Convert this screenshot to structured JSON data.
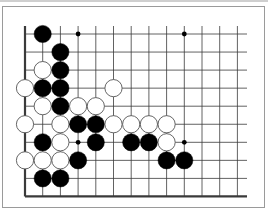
{
  "diagram": {
    "type": "go-board-fragment",
    "columns": 13,
    "rows": 10,
    "edges": {
      "left": true,
      "bottom": true,
      "top": false,
      "right": false
    },
    "star_points": [
      {
        "col": 3,
        "row": 0
      },
      {
        "col": 9,
        "row": 0
      },
      {
        "col": 3,
        "row": 6
      },
      {
        "col": 9,
        "row": 6
      }
    ],
    "stones": [
      {
        "color": "black",
        "col": 1,
        "row": 0
      },
      {
        "color": "black",
        "col": 2,
        "row": 1
      },
      {
        "color": "white",
        "col": 1,
        "row": 2
      },
      {
        "color": "black",
        "col": 2,
        "row": 2
      },
      {
        "color": "white",
        "col": 0,
        "row": 3
      },
      {
        "color": "black",
        "col": 1,
        "row": 3
      },
      {
        "color": "black",
        "col": 2,
        "row": 3
      },
      {
        "color": "white",
        "col": 5,
        "row": 3
      },
      {
        "color": "white",
        "col": 1,
        "row": 4
      },
      {
        "color": "black",
        "col": 2,
        "row": 4
      },
      {
        "color": "white",
        "col": 3,
        "row": 4
      },
      {
        "color": "white",
        "col": 4,
        "row": 4
      },
      {
        "color": "white",
        "col": 0,
        "row": 5
      },
      {
        "color": "white",
        "col": 2,
        "row": 5
      },
      {
        "color": "black",
        "col": 3,
        "row": 5
      },
      {
        "color": "black",
        "col": 4,
        "row": 5
      },
      {
        "color": "white",
        "col": 5,
        "row": 5
      },
      {
        "color": "white",
        "col": 6,
        "row": 5
      },
      {
        "color": "white",
        "col": 7,
        "row": 5
      },
      {
        "color": "white",
        "col": 8,
        "row": 5
      },
      {
        "color": "black",
        "col": 1,
        "row": 6
      },
      {
        "color": "white",
        "col": 2,
        "row": 6
      },
      {
        "color": "black",
        "col": 4,
        "row": 6
      },
      {
        "color": "black",
        "col": 6,
        "row": 6
      },
      {
        "color": "black",
        "col": 7,
        "row": 6
      },
      {
        "color": "white",
        "col": 8,
        "row": 6
      },
      {
        "color": "white",
        "col": 0,
        "row": 7
      },
      {
        "color": "white",
        "col": 1,
        "row": 7
      },
      {
        "color": "white",
        "col": 2,
        "row": 7
      },
      {
        "color": "black",
        "col": 3,
        "row": 7
      },
      {
        "color": "black",
        "col": 8,
        "row": 7
      },
      {
        "color": "black",
        "col": 9,
        "row": 7
      },
      {
        "color": "black",
        "col": 1,
        "row": 8
      },
      {
        "color": "black",
        "col": 2,
        "row": 8
      }
    ],
    "colors": {
      "line": "#3a3a3a",
      "black_stone": "#000000",
      "white_stone": "#ffffff",
      "white_outline": "#555555",
      "frame": "#9a9a9a"
    }
  }
}
